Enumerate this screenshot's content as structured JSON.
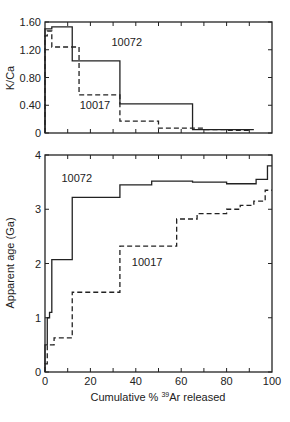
{
  "chart_data": [
    {
      "type": "line",
      "step": true,
      "title": "",
      "xlabel": "",
      "ylabel": "K/Ca",
      "xlim": [
        0,
        100
      ],
      "ylim": [
        0,
        1.6
      ],
      "yticks": [
        "0",
        "0.40",
        "0.80",
        "1.20",
        "1.60"
      ],
      "ytick_values": [
        0,
        0.4,
        0.8,
        1.2,
        1.6
      ],
      "xticks_values": [
        0,
        10,
        20,
        30,
        40,
        50,
        60,
        70,
        80,
        90,
        100
      ],
      "grid": false,
      "series": [
        {
          "name": "10072",
          "style": "solid",
          "steps": [
            [
              0,
              3,
              1.5
            ],
            [
              3,
              12,
              1.53
            ],
            [
              12,
              33,
              1.04
            ],
            [
              33,
              65,
              0.42
            ],
            [
              65,
              92,
              0.05
            ]
          ]
        },
        {
          "name": "10017",
          "style": "dashed",
          "steps": [
            [
              0,
              1,
              1.4
            ],
            [
              1,
              3,
              1.47
            ],
            [
              3,
              15,
              1.24
            ],
            [
              15,
              33,
              0.55
            ],
            [
              33,
              50,
              0.17
            ],
            [
              50,
              70,
              0.07
            ],
            [
              70,
              80,
              0.05
            ],
            [
              80,
              90,
              0.04
            ]
          ]
        }
      ],
      "annotations": [
        {
          "text": "10072",
          "x": 36,
          "y": 1.25
        },
        {
          "text": "10017",
          "x": 22,
          "y": 0.35
        }
      ]
    },
    {
      "type": "line",
      "step": true,
      "title": "",
      "xlabel": "Cumulative % ³⁹Ar released",
      "ylabel": "Apparent age (Ga)",
      "xlim": [
        0,
        100
      ],
      "ylim": [
        0,
        4
      ],
      "yticks": [
        "0",
        "1",
        "2",
        "3",
        "4"
      ],
      "ytick_values": [
        0,
        1,
        2,
        3,
        4
      ],
      "xticks": [
        "0",
        "20",
        "40",
        "60",
        "80",
        "100"
      ],
      "xtick_values": [
        0,
        20,
        40,
        60,
        80,
        100
      ],
      "grid": false,
      "series": [
        {
          "name": "10072",
          "style": "solid",
          "steps": [
            [
              0,
              1,
              0.5
            ],
            [
              1,
              2,
              1.0
            ],
            [
              2,
              3,
              1.1
            ],
            [
              3,
              12,
              2.07
            ],
            [
              12,
              33,
              3.22
            ],
            [
              33,
              47,
              3.45
            ],
            [
              47,
              65,
              3.52
            ],
            [
              65,
              80,
              3.5
            ],
            [
              80,
              93,
              3.47
            ],
            [
              93,
              98,
              3.55
            ],
            [
              98,
              100,
              3.8
            ]
          ]
        },
        {
          "name": "10017",
          "style": "dashed",
          "steps": [
            [
              0,
              1,
              0.15
            ],
            [
              1,
              4,
              0.5
            ],
            [
              4,
              12,
              0.63
            ],
            [
              12,
              33,
              1.47
            ],
            [
              33,
              58,
              2.32
            ],
            [
              58,
              67,
              2.82
            ],
            [
              67,
              80,
              2.92
            ],
            [
              80,
              86,
              3.0
            ],
            [
              86,
              92,
              3.07
            ],
            [
              92,
              97,
              3.15
            ],
            [
              97,
              100,
              3.35
            ]
          ]
        }
      ],
      "annotations": [
        {
          "text": "10072",
          "x": 14,
          "y": 3.5
        },
        {
          "text": "10017",
          "x": 45,
          "y": 1.95
        }
      ]
    }
  ],
  "labels": {
    "top_ylabel": "K/Ca",
    "bottom_ylabel": "Apparent age (Ga)",
    "xlabel_prefix": "Cumulative % ",
    "xlabel_sup": "39",
    "xlabel_suffix": "Ar released"
  }
}
